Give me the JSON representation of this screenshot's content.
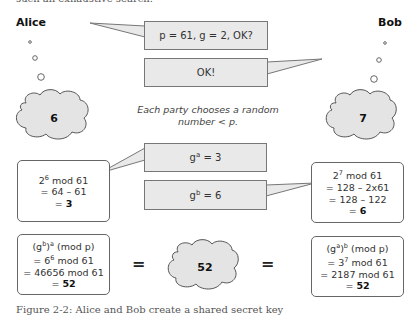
{
  "top_text": "such an exhaustive search.",
  "participants": {
    "alice": "Alice",
    "bob": "Bob"
  },
  "messages": [
    {
      "text": "p = 61, g = 2, OK?",
      "from": "Alice"
    },
    {
      "text": "OK!",
      "from": "Bob"
    }
  ],
  "secrets": {
    "alice": "6",
    "bob": "7"
  },
  "note": {
    "line1": "Each party chooses a random",
    "line2": "number < p."
  },
  "public_messages": [
    {
      "base": "g",
      "exp": "a",
      "value": "= 3"
    },
    {
      "base": "g",
      "exp": "b",
      "value": "= 6"
    }
  ],
  "alice_calc": {
    "l1_base": "2",
    "l1_exp": "6",
    "l1_rest": " mod 61",
    "l2": "= 64 – 61",
    "l3_prefix": "= ",
    "l3_result": "3"
  },
  "bob_calc": {
    "l1_base": "2",
    "l1_exp": "7",
    "l1_rest": " mod 61",
    "l2": "= 128 – 2x61",
    "l3": "= 128 – 122",
    "l4_prefix": "= ",
    "l4_result": "6"
  },
  "alice_final": {
    "l1_a": "(g",
    "l1_sup1": "b",
    "l1_b": ")",
    "l1_sup2": "a",
    "l1_c": " (mod p)",
    "l2_a": "= 6",
    "l2_sup": "6",
    "l2_b": " mod 61",
    "l3": "= 46656 mod 61",
    "l4_prefix": "= ",
    "l4_result": "52"
  },
  "bob_final": {
    "l1_a": "(g",
    "l1_sup1": "a",
    "l1_b": ")",
    "l1_sup2": "b",
    "l1_c": " (mod p)",
    "l2_a": "= 3",
    "l2_sup": "7",
    "l2_b": " mod 61",
    "l3": "= 2187 mod 61",
    "l4_prefix": "= ",
    "l4_result": "52"
  },
  "shared_secret": "52",
  "equals": "=",
  "caption": "Figure 2-2: Alice and Bob create a shared secret key"
}
